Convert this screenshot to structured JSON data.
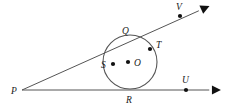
{
  "figure": {
    "width": 229,
    "height": 108,
    "background_color": "#ffffff",
    "stroke_color": "#555555",
    "label_color": "#1a1a1a"
  },
  "circle": {
    "name": "circle-O",
    "center_label": "O",
    "cx": 130,
    "cy": 62,
    "r": 27
  },
  "points": [
    {
      "id": "P",
      "label": "P",
      "x": 22,
      "y": 90,
      "dot": false,
      "label_x": 11,
      "label_y": 94
    },
    {
      "id": "Q",
      "label": "Q",
      "x": 126,
      "y": 37,
      "dot": false,
      "label_x": 122,
      "label_y": 34
    },
    {
      "id": "T",
      "label": "T",
      "x": 150,
      "y": 49,
      "dot": true,
      "label_x": 156,
      "label_y": 48
    },
    {
      "id": "S",
      "label": "S",
      "x": 113,
      "y": 64,
      "dot": true,
      "label_x": 101,
      "label_y": 68
    },
    {
      "id": "O",
      "label": "O",
      "x": 128,
      "y": 62,
      "dot": true,
      "label_x": 134,
      "label_y": 66
    },
    {
      "id": "R",
      "label": "R",
      "x": 130,
      "y": 89,
      "dot": false,
      "label_x": 126,
      "label_y": 103
    },
    {
      "id": "U",
      "label": "U",
      "x": 186,
      "y": 90,
      "dot": true,
      "label_x": 182,
      "label_y": 83
    },
    {
      "id": "V",
      "label": "V",
      "x": 180,
      "y": 16,
      "dot": true,
      "label_x": 176,
      "label_y": 10
    }
  ],
  "rays": [
    {
      "id": "ray-PV",
      "name": "tangent-ray-through-Q-and-V",
      "x1": 22,
      "y1": 90,
      "x2": 205,
      "y2": 8,
      "arrow_at_end": true
    },
    {
      "id": "ray-PU",
      "name": "tangent-ray-through-R-and-U",
      "x1": 22,
      "y1": 90,
      "x2": 216,
      "y2": 90,
      "arrow_at_end": true
    }
  ]
}
